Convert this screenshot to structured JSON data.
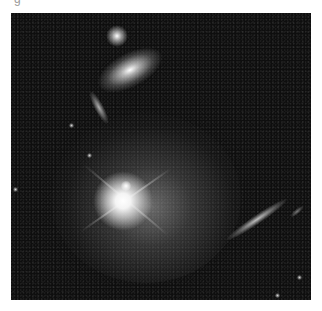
{
  "image": {
    "description": "Grayscale deep-field astronomical photograph: bright galaxy with diffraction spikes and diffuse halo lower-left, elliptical galaxy and compact source at top, edge-on galaxies at left-center and lower-right, on a noisy dark background",
    "caption_fragment": "g",
    "colors": {
      "background": "#0e0e0e",
      "page": "#ffffff"
    }
  }
}
